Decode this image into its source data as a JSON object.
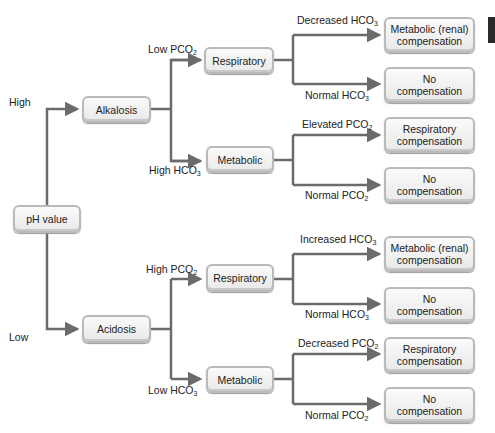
{
  "diagram": {
    "root": {
      "label": "pH value"
    },
    "ph_branches": {
      "high_label": "High",
      "low_label": "Low"
    },
    "alkalosis": {
      "label": "Alkalosis",
      "branch_labels": {
        "top": "Low PCO",
        "top_sub": "2",
        "bottom": "High HCO",
        "bottom_sub": "3"
      },
      "respiratory": {
        "label": "Respiratory",
        "branch_labels": {
          "top": "Decreased HCO",
          "top_sub": "3",
          "bottom": "Normal HCO",
          "bottom_sub": "3"
        },
        "outcomes": [
          "Metabolic (renal)\ncompensation",
          "No\ncompensation"
        ]
      },
      "metabolic": {
        "label": "Metabolic",
        "branch_labels": {
          "top": "Elevated PCO",
          "top_sub": "2",
          "bottom": "Normal PCO",
          "bottom_sub": "2"
        },
        "outcomes": [
          "Respiratory\ncompensation",
          "No\ncompensation"
        ]
      }
    },
    "acidosis": {
      "label": "Acidosis",
      "branch_labels": {
        "top": "High PCO",
        "top_sub": "2",
        "bottom": "Low HCO",
        "bottom_sub": "3"
      },
      "respiratory": {
        "label": "Respiratory",
        "branch_labels": {
          "top": "Increased HCO",
          "top_sub": "3",
          "bottom": "Normal HCO",
          "bottom_sub": "3"
        },
        "outcomes": [
          "Metabolic (renal)\ncompensation",
          "No\ncompensation"
        ]
      },
      "metabolic": {
        "label": "Metabolic",
        "branch_labels": {
          "top": "Decreased PCO",
          "top_sub": "2",
          "bottom": "Normal PCO",
          "bottom_sub": "2"
        },
        "outcomes": [
          "Respiratory\ncompensation",
          "No\ncompensation"
        ]
      }
    },
    "colors": {
      "line": "#6b6b6b",
      "box_border": "#b9b9b9",
      "box_fill": "#f2f2f2",
      "side_tab": "#2a2a2a"
    }
  }
}
